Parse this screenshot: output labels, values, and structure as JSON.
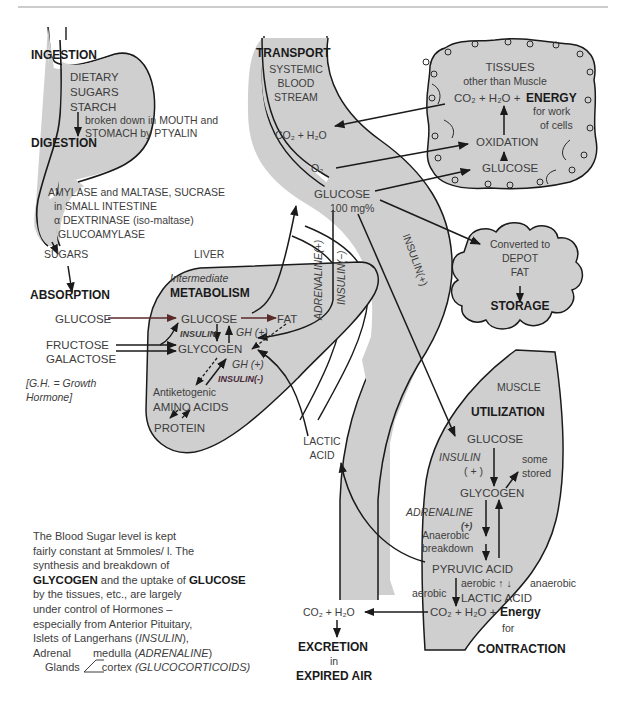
{
  "colors": {
    "fill": "#cfcfcf",
    "stroke": "#1a1a1a",
    "text": "#3d3d3d",
    "bold_text": "#1a1a1a",
    "arrow_red": "#5a2a2a",
    "rule": "#9a9a9a"
  },
  "ingestion": {
    "title": "INGESTION",
    "dietary": "DIETARY",
    "sugars": "SUGARS",
    "starch": "STARCH",
    "broken_1": "broken down in MOUTH and",
    "broken_2": "STOMACH by PTYALIN",
    "digestion": "DIGESTION",
    "enzymes_1": "AMYLASE and MALTASE, SUCRASE",
    "enzymes_2": "in SMALL INTESTINE",
    "enzymes_3": "α DEXTRINASE (iso-maltase)",
    "enzymes_4": "GLUCOAMYLASE",
    "sugars_out": "SUGARS",
    "absorption": "ABSORPTION"
  },
  "absorbed": {
    "glucose": "GLUCOSE",
    "fructose": "FRUCTOSE",
    "galactose": "GALACTOSE",
    "gh_note_1": "[G.H. = Growth",
    "gh_note_2": "Hormone]"
  },
  "liver": {
    "label": "LIVER",
    "intermediate": "Intermediate",
    "metabolism": "METABOLISM",
    "glucose": "GLUCOSE",
    "fat": "FAT",
    "insulin": "INSULIN",
    "gh_plus_1": "GH (+)",
    "glycogen": "GLYCOGEN",
    "gh_plus_2": "GH (+)",
    "insulin_minus": "INSULIN(-)",
    "antiketogenic": "Antiketogenic",
    "amino_acids": "AMINO ACIDS",
    "protein": "PROTEIN"
  },
  "transport": {
    "title": "TRANSPORT",
    "systemic": "SYSTEMIC",
    "blood": "BLOOD",
    "stream": "STREAM",
    "co2_h2o": "CO₂ + H₂O",
    "o2": "O₂",
    "glucose": "GLUCOSE",
    "level": "100 mg%",
    "adrenaline_plus": "ADRENALINE(+)",
    "insulin_minus": "INSULIN(−)",
    "insulin_plus": "INSULIN(+)",
    "lactic": "LACTIC",
    "acid": "ACID"
  },
  "tissues": {
    "title": "TISSUES",
    "subtitle": "other than Muscle",
    "products": "CO₂ + H₂O +",
    "energy": "ENERGY",
    "for_work": "for work",
    "of_cells": "of cells",
    "oxidation": "OXIDATION",
    "glucose": "GLUCOSE"
  },
  "storage": {
    "converted": "Converted to",
    "depot": "DEPOT",
    "fat": "FAT",
    "title": "STORAGE"
  },
  "muscle": {
    "label": "MUSCLE",
    "title": "UTILIZATION",
    "glucose": "GLUCOSE",
    "insulin": "INSULIN",
    "insulin_plus": "( + )",
    "some": "some",
    "stored": "stored",
    "glycogen": "GLYCOGEN",
    "adrenaline": "ADRENALINE",
    "adrenaline_plus": "(+)",
    "anaerobic": "Anaerobic",
    "breakdown": "breakdown",
    "pyruvic": "PYRUVIC ACID",
    "aerobic_mid": "aerobic ↑ ↓",
    "anaerobic_right": "anaerobic",
    "aerobic_left": "aerobic",
    "lactic": "LACTIC ACID",
    "products": "CO₂ + H₂O +",
    "energy": "Energy",
    "for": "for",
    "contraction": "CONTRACTION"
  },
  "excretion": {
    "co2_h2o": "CO₂ + H₂O",
    "title": "EXCRETION",
    "in": "in",
    "air": "EXPIRED AIR"
  },
  "paragraph": {
    "l1": "The Blood Sugar level is kept",
    "l2": "fairly constant at 5mmoles/ l.  The",
    "l3": "synthesis and breakdown of",
    "l4a": "GLYCOGEN",
    "l4b": " and the uptake of ",
    "l4c": "GLUCOSE",
    "l5": "by the tissues, etc., are largely",
    "l6": "under control of Hormones –",
    "l7": "especially from Anterior Pituitary,",
    "l8a": "Islets of Langerhans (",
    "l8b": "INSULIN",
    "l8c": "),",
    "l9a": "Adrenal",
    "l9b": "medulla (",
    "l9c": "ADRENALINE",
    "l9d": ")",
    "l10a": "Glands",
    "l10b": "cortex ",
    "l10c": "(GLUCOCORTICOIDS)"
  }
}
